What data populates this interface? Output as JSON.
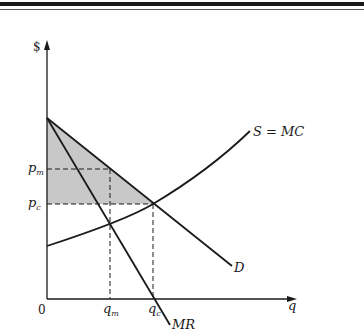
{
  "diagram": {
    "axes": {
      "y_label": "$",
      "x_label": "q",
      "origin_label": "0"
    },
    "curves": {
      "supply_label": "S = MC",
      "demand_label": "D",
      "marginal_revenue_label": "MR"
    },
    "price_labels": {
      "p_m": {
        "base": "p",
        "sub": "m"
      },
      "p_c": {
        "base": "p",
        "sub": "c"
      }
    },
    "quantity_labels": {
      "q_m": {
        "base": "q",
        "sub": "m"
      },
      "q_c": {
        "base": "q",
        "sub": "c"
      }
    },
    "shaded_region": "area between demand curve and price axis above p_c",
    "colors": {
      "line": "#1a1a1a",
      "shade": "#c8c8c8",
      "background": "#ffffff"
    }
  }
}
